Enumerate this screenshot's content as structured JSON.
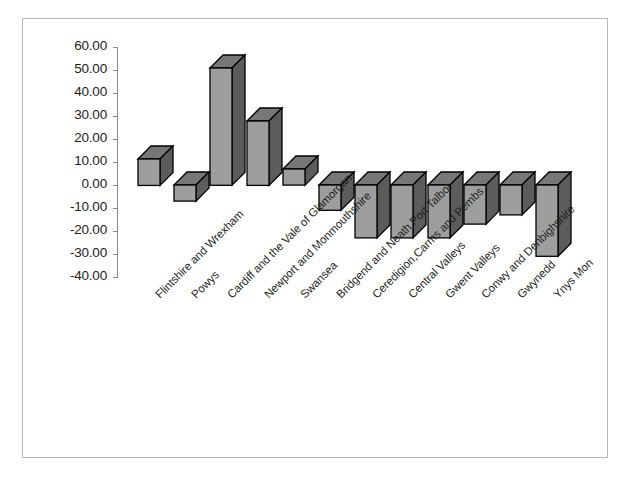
{
  "chart_data": {
    "type": "bar",
    "title": "",
    "subtitle": "",
    "xlabel": "",
    "ylabel": "",
    "ylim": [
      -40,
      60
    ],
    "ytick_step": 10,
    "grid": false,
    "legend": false,
    "style": "3d-column",
    "bar_face_color": "#9e9e9e",
    "bar_top_color": "#777777",
    "bar_side_color": "#5c5c5c",
    "bar_outline_color": "#000000",
    "frame_color": "#b9b9b9",
    "axis_color": "#8a8a8a",
    "background_color": "#ffffff",
    "ytick_labels": [
      "60.00",
      "50.00",
      "40.00",
      "30.00",
      "20.00",
      "10.00",
      "0.00",
      "-10.00",
      "-20.00",
      "-30.00",
      "-40.00"
    ],
    "categories": [
      "Flintshire and Wrexham",
      "Powys",
      "Cardiff and the Vale of Glamorgan",
      "Newport and Monmouthshire",
      "Swansea",
      "Bridgend and Neath Port Talbot",
      "Ceredigion,Carms and Pembs",
      "Central Valleys",
      "Gwent Valleys",
      "Conwy and Denbighshire",
      "Gwynedd",
      "Ynys Mon"
    ],
    "values": [
      11.5,
      -7.0,
      51.0,
      28.0,
      7.0,
      -11.0,
      -23.0,
      -23.0,
      -23.0,
      -17.0,
      -13.0,
      -31.0
    ]
  }
}
